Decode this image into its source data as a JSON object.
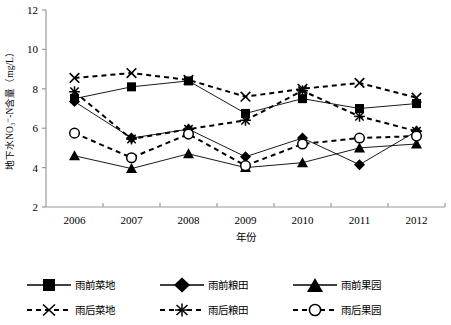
{
  "chart_data": {
    "type": "line",
    "title": "",
    "xlabel": "年份",
    "ylabel": "地下水NO₃⁻-N含量（mg/L）",
    "categories": [
      "2006",
      "2007",
      "2008",
      "2009",
      "2010",
      "2011",
      "2012"
    ],
    "ylim": [
      2,
      12
    ],
    "yticks": [
      2,
      4,
      6,
      8,
      10,
      12
    ],
    "ytick_labels": [
      "2",
      "4",
      "6",
      "8",
      "10",
      "12"
    ],
    "grid": false,
    "legend_position": "below",
    "series": [
      {
        "name": "雨前菜地",
        "marker": "filled-square",
        "line": "solid",
        "values": [
          7.5,
          8.1,
          8.4,
          6.75,
          7.5,
          7.0,
          7.25
        ]
      },
      {
        "name": "雨前粮田",
        "marker": "filled-diamond",
        "line": "solid",
        "values": [
          7.35,
          5.5,
          5.95,
          4.55,
          5.5,
          4.15,
          5.85
        ]
      },
      {
        "name": "雨前果园",
        "marker": "filled-triangle",
        "line": "solid",
        "values": [
          4.6,
          3.95,
          4.7,
          4.0,
          4.25,
          5.0,
          5.2
        ]
      },
      {
        "name": "雨后菜地",
        "marker": "cross-x",
        "line": "dashed",
        "values": [
          8.55,
          8.8,
          8.45,
          7.6,
          8.0,
          8.3,
          7.55
        ]
      },
      {
        "name": "雨后粮田",
        "marker": "asterisk",
        "line": "dashed",
        "values": [
          7.85,
          5.45,
          5.95,
          6.4,
          7.9,
          6.6,
          5.85
        ]
      },
      {
        "name": "雨后果园",
        "marker": "open-circle",
        "line": "dashed",
        "values": [
          5.75,
          4.5,
          5.7,
          4.1,
          5.2,
          5.5,
          5.6
        ]
      }
    ]
  },
  "legend": {
    "rows": [
      [
        {
          "label": "雨前菜地",
          "marker": "filled-square",
          "line": "solid"
        },
        {
          "label": "雨前粮田",
          "marker": "filled-diamond",
          "line": "solid"
        },
        {
          "label": "雨前果园",
          "marker": "filled-triangle",
          "line": "solid"
        }
      ],
      [
        {
          "label": "雨后菜地",
          "marker": "cross-x",
          "line": "dashed"
        },
        {
          "label": "雨后粮田",
          "marker": "asterisk",
          "line": "dashed"
        },
        {
          "label": "雨后果园",
          "marker": "open-circle",
          "line": "dashed"
        }
      ]
    ]
  },
  "colors": {
    "series": "#000000",
    "axis": "#999999",
    "background": "#ffffff"
  }
}
